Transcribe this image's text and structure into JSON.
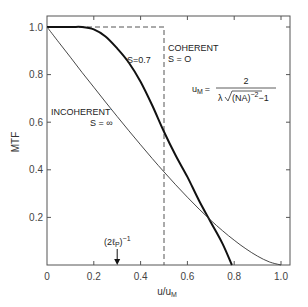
{
  "chart_data": {
    "type": "line",
    "title": "",
    "xlabel": "u/u_M",
    "ylabel": "MTF",
    "xlim": [
      0,
      1.0
    ],
    "ylim": [
      0,
      1.0
    ],
    "grid": false,
    "x_ticks": [
      0,
      0.2,
      0.4,
      0.6,
      0.8,
      1.0
    ],
    "x_tick_labels": [
      "0",
      "0.2",
      "0.4",
      "0.6",
      "0.8",
      "1.0"
    ],
    "y_ticks": [
      0.2,
      0.4,
      0.6,
      0.8,
      1.0
    ],
    "y_tick_labels": [
      "0.2",
      "0.4",
      "0.6",
      "0.8",
      "1.0"
    ],
    "series": [
      {
        "name": "Coherent S=0",
        "style": "dashed",
        "x": [
          0,
          0.5,
          0.5
        ],
        "y": [
          1.0,
          1.0,
          0
        ]
      },
      {
        "name": "S=0.7",
        "style": "bold",
        "x": [
          0,
          0.1,
          0.15,
          0.2,
          0.25,
          0.3,
          0.35,
          0.4,
          0.45,
          0.5,
          0.55,
          0.6,
          0.65,
          0.7,
          0.75,
          0.79
        ],
        "y": [
          1.0,
          1.0,
          1.0,
          0.99,
          0.96,
          0.91,
          0.85,
          0.77,
          0.67,
          0.56,
          0.46,
          0.37,
          0.27,
          0.18,
          0.09,
          0.0
        ]
      },
      {
        "name": "Incoherent S=∞",
        "style": "thin",
        "x": [
          0,
          0.05,
          0.1,
          0.15,
          0.2,
          0.25,
          0.3,
          0.35,
          0.4,
          0.45,
          0.5,
          0.55,
          0.6,
          0.65,
          0.7,
          0.75,
          0.8,
          0.85,
          0.9,
          0.95,
          1.0
        ],
        "y": [
          1.0,
          0.936,
          0.873,
          0.809,
          0.747,
          0.685,
          0.624,
          0.564,
          0.505,
          0.447,
          0.391,
          0.337,
          0.285,
          0.235,
          0.188,
          0.144,
          0.104,
          0.068,
          0.037,
          0.013,
          0.0
        ]
      }
    ],
    "annotations": {
      "coherent_line1": "COHERENT",
      "coherent_line2": "S = O",
      "partial": "S=0.7",
      "incoherent_line1": "INCOHERENT",
      "incoherent_line2": "S = ∞",
      "formula_lhs": "u",
      "formula_lhs_sub": "M",
      "formula_eq": "=",
      "formula_num": "2",
      "formula_den_prefix": "λ",
      "formula_den_radicand": "(NA)",
      "formula_den_exp": "−2",
      "formula_den_suffix": "−1",
      "arrow_label": "(2ℓ",
      "arrow_label_sub": "P",
      "arrow_label_close": ")",
      "arrow_label_exp": "−1",
      "arrow_x": 0.3
    }
  }
}
